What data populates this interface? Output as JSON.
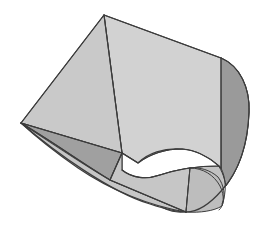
{
  "figure": {
    "title": "",
    "type": "3d-geometric-solid",
    "description": "Shaded three-dimensional solid: a cylindrical ungula (hoof) blended into a wedge/prism, drawn in flat grey tones with thin dark outlines on a white background.",
    "background_color": "#ffffff",
    "canvas": {
      "width": 268,
      "height": 227
    },
    "palette": {
      "face_light": "#d4d4d4",
      "face_mid": "#c6c6c6",
      "face_medium": "#bdbdbd",
      "face_dark": "#a3a3a3",
      "face_darker": "#949494",
      "face_hole": "#ffffff",
      "outline": "#3c3c3c",
      "outline_soft": "#555555"
    },
    "stroke_width": 1.1,
    "vertices": {
      "apex_top": [
        104,
        15
      ],
      "apex_left": [
        21,
        123
      ],
      "corner_top_right": [
        221,
        58
      ],
      "ridge_mid": [
        122,
        153
      ],
      "vertical_line_top": [
        221,
        58
      ],
      "vertical_line_bottom": [
        221,
        168
      ],
      "lower_left_break": [
        110,
        180
      ],
      "bottom_curve_low": [
        186,
        212
      ],
      "right_extreme": [
        248,
        165
      ],
      "arc_right_top": [
        248,
        110
      ]
    },
    "faces": [
      {
        "name": "top-left-quad",
        "shade": "face_mid"
      },
      {
        "name": "top-right-quad",
        "shade": "face_light"
      },
      {
        "name": "left-dark-wedge",
        "shade": "face_dark"
      },
      {
        "name": "lower-left-band",
        "shade": "face_medium"
      },
      {
        "name": "cylinder-barrel",
        "shade": "face_mid"
      },
      {
        "name": "right-dark-gusset",
        "shade": "face_darker"
      },
      {
        "name": "interior-opening",
        "shade": "face_hole"
      }
    ],
    "edges": [
      {
        "name": "apex-to-left",
        "from": "apex_top",
        "to": "apex_left",
        "kind": "straight"
      },
      {
        "name": "apex-to-corner",
        "from": "apex_top",
        "to": "corner_top_right",
        "kind": "straight"
      },
      {
        "name": "apex-to-ridge",
        "from": "apex_top",
        "to": "ridge_mid",
        "kind": "straight"
      },
      {
        "name": "left-to-ridge",
        "from": "apex_left",
        "to": "ridge_mid",
        "kind": "straight"
      },
      {
        "name": "vertical-seam",
        "from": "vertical_line_top",
        "to": "vertical_line_bottom",
        "kind": "straight"
      },
      {
        "name": "right-arc",
        "from": "corner_top_right",
        "to": "right_extreme",
        "kind": "arc"
      },
      {
        "name": "bottom-arc",
        "from": "apex_left",
        "to": "bottom_curve_low",
        "kind": "arc"
      },
      {
        "name": "ridge-to-break",
        "from": "ridge_mid",
        "to": "lower_left_break",
        "kind": "straight"
      },
      {
        "name": "break-to-bottom",
        "from": "lower_left_break",
        "to": "bottom_curve_low",
        "kind": "straight"
      }
    ]
  }
}
